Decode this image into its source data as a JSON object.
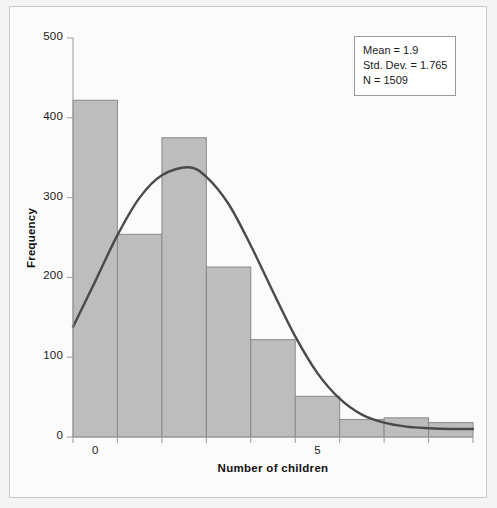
{
  "chart_data": {
    "type": "bar",
    "title": "",
    "xlabel": "Number of children",
    "ylabel": "Frequency",
    "categories": [
      "0",
      "1",
      "2",
      "3",
      "4",
      "5",
      "6",
      "7",
      "8"
    ],
    "values": [
      422,
      254,
      375,
      213,
      122,
      51,
      22,
      24,
      18
    ],
    "x": [
      0,
      1,
      2,
      3,
      4,
      5,
      6,
      7,
      8
    ],
    "xlim": [
      -0.5,
      8.5
    ],
    "ylim": [
      0,
      500
    ],
    "ytick_labels": [
      "0",
      "100",
      "200",
      "300",
      "400",
      "500"
    ],
    "ytick_values": [
      0,
      100,
      200,
      300,
      400,
      500
    ],
    "xtick_labels": [
      "0",
      "5"
    ],
    "xtick_values": [
      0,
      5
    ],
    "grid": false,
    "legend_position": "top-right",
    "bar_color": "#bdbdbd",
    "bar_edge_color": "#8a8a8a",
    "curve_color": "#4a4a4a",
    "overlay_curve": {
      "name": "normal",
      "mean": 1.9,
      "std_dev": 1.765,
      "n": 1509,
      "points": [
        {
          "x": -0.5,
          "y": 138
        },
        {
          "x": 0.0,
          "y": 195
        },
        {
          "x": 0.5,
          "y": 253
        },
        {
          "x": 1.0,
          "y": 300
        },
        {
          "x": 1.5,
          "y": 328
        },
        {
          "x": 2.1,
          "y": 338
        },
        {
          "x": 2.5,
          "y": 326
        },
        {
          "x": 3.0,
          "y": 292
        },
        {
          "x": 3.5,
          "y": 240
        },
        {
          "x": 4.0,
          "y": 182
        },
        {
          "x": 4.5,
          "y": 126
        },
        {
          "x": 5.0,
          "y": 80
        },
        {
          "x": 5.5,
          "y": 48
        },
        {
          "x": 6.0,
          "y": 28
        },
        {
          "x": 6.5,
          "y": 18
        },
        {
          "x": 7.0,
          "y": 13
        },
        {
          "x": 7.5,
          "y": 11
        },
        {
          "x": 8.0,
          "y": 10
        },
        {
          "x": 8.5,
          "y": 10
        }
      ]
    }
  },
  "legend": {
    "mean": "Mean = 1.9",
    "std_dev": "Std. Dev. = 1.765",
    "n": "N = 1509"
  },
  "axes": {
    "y_title": "Frequency",
    "x_title": "Number of children"
  }
}
